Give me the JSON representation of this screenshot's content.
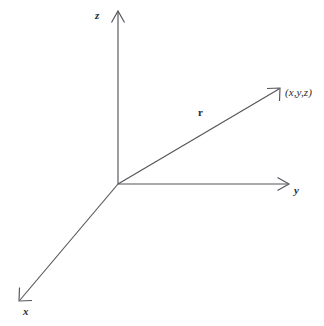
{
  "figure": {
    "kind": "diagram",
    "background_color": "#ffffff",
    "line_color": "#54545a",
    "text_color": "#2b2b2b"
  },
  "labels": {
    "z_axis": "z",
    "y_axis": "y",
    "x_axis": "x",
    "vector": "r",
    "point": "(x,y,z)"
  },
  "geometry": {
    "origin": {
      "x": 118,
      "y": 184
    },
    "axes": [
      {
        "name": "z-axis",
        "from": {
          "x": 118,
          "y": 184
        },
        "to": {
          "x": 118,
          "y": 12
        }
      },
      {
        "name": "y-axis",
        "from": {
          "x": 118,
          "y": 184
        },
        "to": {
          "x": 288,
          "y": 184
        }
      },
      {
        "name": "x-axis",
        "from": {
          "x": 118,
          "y": 184
        },
        "to": {
          "x": 20,
          "y": 300
        }
      }
    ],
    "vector": {
      "name": "r",
      "from": {
        "x": 118,
        "y": 184
      },
      "to": {
        "x": 279,
        "y": 89
      }
    }
  }
}
